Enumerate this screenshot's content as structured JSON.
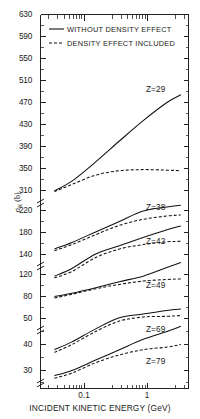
{
  "chart_data": {
    "type": "line",
    "title": "",
    "xlabel": "INCIDENT KINETIC ENERGY (GeV)",
    "ylabel_main": "σ",
    "ylabel_sub": "K",
    "ylabel_unit": " (b)",
    "ylabel_full": "σ_K (b)",
    "xscale": "log",
    "xlim": [
      0.04,
      3.0
    ],
    "xticks": [
      {
        "value": 0.1,
        "label": "0.1"
      },
      {
        "value": 1.0,
        "label": "1"
      }
    ],
    "yscale": "broken-linear",
    "yticks": [
      {
        "label": "630",
        "value": 630
      },
      {
        "label": "590",
        "value": 590
      },
      {
        "label": "550",
        "value": 550
      },
      {
        "label": "510",
        "value": 510
      },
      {
        "label": "470",
        "value": 470
      },
      {
        "label": "430",
        "value": 430
      },
      {
        "label": "390",
        "value": 390
      },
      {
        "label": "350",
        "value": 350
      },
      {
        "label": "310",
        "value": 310
      },
      {
        "label": "220",
        "value": 220
      },
      {
        "label": "180",
        "value": 180
      },
      {
        "label": "140",
        "value": 140
      },
      {
        "label": "120",
        "value": 120
      },
      {
        "label": "80",
        "value": 80
      },
      {
        "label": "50",
        "value": 50
      },
      {
        "label": "40",
        "value": 40
      },
      {
        "label": "30",
        "value": 30
      }
    ],
    "axis_breaks": [
      "310/220",
      "140/120",
      "80/50"
    ],
    "grid": false,
    "legend_position": "top-center",
    "legend": [
      {
        "label": "WITHOUT DENSITY EFFECT",
        "style": "solid"
      },
      {
        "label": "DENSITY EFFECT INCLUDED",
        "style": "dashed"
      }
    ],
    "series": [
      {
        "name": "Z=29",
        "label": "Z=29",
        "solid": {
          "x": [
            0.06,
            0.1,
            0.2,
            0.4,
            0.8,
            1.6,
            2.4
          ],
          "y": [
            308,
            327,
            362,
            400,
            437,
            470,
            484
          ]
        },
        "dashed": {
          "x": [
            0.06,
            0.1,
            0.2,
            0.4,
            0.8,
            1.6,
            2.4
          ],
          "y": [
            305,
            321,
            338,
            346,
            348,
            347,
            346
          ]
        }
      },
      {
        "name": "Z=38",
        "label": "Z=38",
        "solid": {
          "x": [
            0.06,
            0.1,
            0.2,
            0.4,
            0.8,
            1.6,
            2.4
          ],
          "y": [
            150,
            162,
            181,
            200,
            219,
            236,
            244
          ]
        },
        "dashed": {
          "x": [
            0.06,
            0.1,
            0.2,
            0.4,
            0.8,
            1.6,
            2.4
          ],
          "y": [
            147,
            158,
            176,
            193,
            204,
            210,
            212
          ]
        }
      },
      {
        "name": "Z=42",
        "label": "Z=42",
        "solid": {
          "x": [
            0.06,
            0.1,
            0.2,
            0.4,
            0.8,
            1.6,
            2.4
          ],
          "y": [
            117,
            126,
            141,
            156,
            171,
            185,
            192
          ]
        },
        "dashed": {
          "x": [
            0.06,
            0.1,
            0.2,
            0.4,
            0.8,
            1.6,
            2.4
          ],
          "y": [
            114,
            123,
            137,
            150,
            158,
            163,
            164
          ]
        }
      },
      {
        "name": "Z=49",
        "label": "Z=49",
        "solid": {
          "x": [
            0.06,
            0.1,
            0.2,
            0.4,
            0.8,
            1.6,
            2.4
          ],
          "y": [
            80,
            86,
            96,
            107,
            117,
            127,
            132
          ]
        },
        "dashed": {
          "x": [
            0.06,
            0.1,
            0.2,
            0.4,
            0.8,
            1.6,
            2.4
          ],
          "y": [
            78,
            84,
            94,
            102,
            108,
            111,
            112
          ]
        }
      },
      {
        "name": "Z=69",
        "label": "Z=69",
        "solid": {
          "x": [
            0.06,
            0.1,
            0.2,
            0.4,
            0.8,
            1.6,
            2.4
          ],
          "y": [
            38,
            41,
            46,
            51,
            56,
            61,
            63
          ]
        },
        "dashed": {
          "x": [
            0.06,
            0.1,
            0.2,
            0.4,
            0.8,
            1.6,
            2.4
          ],
          "y": [
            37,
            40,
            45,
            49,
            52,
            53,
            54
          ]
        }
      },
      {
        "name": "Z=79",
        "label": "Z=79",
        "solid": {
          "x": [
            0.06,
            0.1,
            0.2,
            0.4,
            0.8,
            1.6,
            2.4
          ],
          "y": [
            28,
            30,
            34,
            38,
            42,
            45,
            47
          ]
        },
        "dashed": {
          "x": [
            0.06,
            0.1,
            0.2,
            0.4,
            0.8,
            1.6,
            2.4
          ],
          "y": [
            27,
            29,
            33,
            36,
            38,
            39,
            40
          ]
        }
      }
    ]
  }
}
